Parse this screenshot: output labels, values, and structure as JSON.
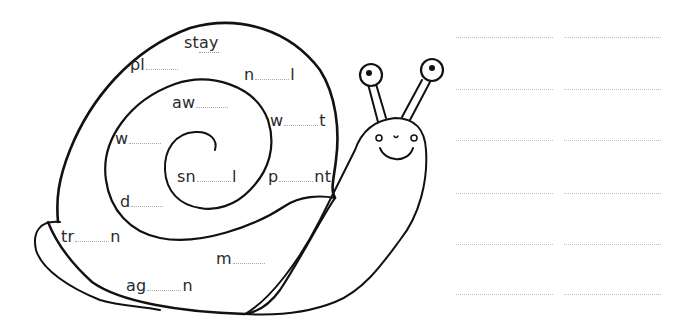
{
  "worksheet": {
    "title": "ay word snail",
    "example_word": {
      "prefix": "st",
      "target": "ay",
      "suffix": ""
    },
    "words": [
      {
        "id": "pl",
        "before": "pl",
        "after": "",
        "x": 130,
        "y": 56
      },
      {
        "id": "n_l",
        "before": "n",
        "after": "l",
        "x": 244,
        "y": 66
      },
      {
        "id": "aw",
        "before": "aw",
        "after": "",
        "x": 172,
        "y": 94
      },
      {
        "id": "w_t",
        "before": "w",
        "after": "t",
        "x": 270,
        "y": 112
      },
      {
        "id": "w",
        "before": "w",
        "after": "",
        "x": 115,
        "y": 130
      },
      {
        "id": "sn_l",
        "before": "sn",
        "after": "l",
        "x": 177,
        "y": 168
      },
      {
        "id": "p_nt",
        "before": "p",
        "after": "nt",
        "x": 268,
        "y": 168
      },
      {
        "id": "d",
        "before": "d",
        "after": "",
        "x": 120,
        "y": 193
      },
      {
        "id": "tr_n",
        "before": "tr",
        "after": "n",
        "x": 61,
        "y": 228
      },
      {
        "id": "m",
        "before": "m",
        "after": "",
        "x": 216,
        "y": 250
      },
      {
        "id": "ag_n",
        "before": "ag",
        "after": "n",
        "x": 126,
        "y": 277
      }
    ],
    "answer_lines": {
      "rows_y": [
        37,
        89,
        140,
        193,
        244,
        294
      ],
      "columns": [
        {
          "x": 456,
          "width": 97
        },
        {
          "x": 564,
          "width": 97
        }
      ],
      "count": 12
    },
    "colors": {
      "ink": "#111111",
      "text": "#2a2a2a",
      "dotted_line": "#bdbdbd",
      "background": "#ffffff"
    }
  }
}
